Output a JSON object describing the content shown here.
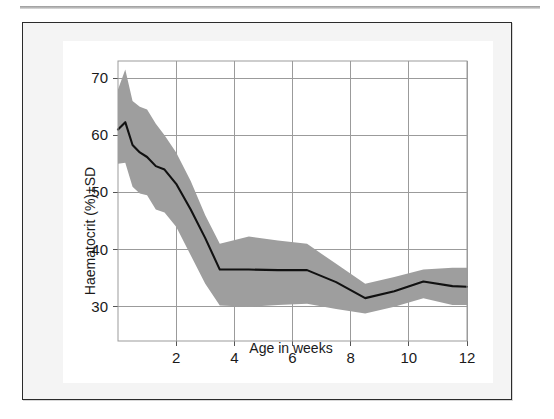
{
  "figure": {
    "background": "#f4f4f4",
    "panel_background": "#ffffff",
    "border_color": "#2b2b2b"
  },
  "chart_data": {
    "type": "line",
    "title": "",
    "subtitle": "",
    "xlabel": "Age in weeks",
    "ylabel": "Haematocrit (%)±SD",
    "xlim": [
      0,
      12
    ],
    "ylim": [
      24,
      73
    ],
    "xticks": [
      2,
      4,
      6,
      8,
      10,
      12
    ],
    "xticklabels": [
      "2",
      "4",
      "6",
      "8",
      "10",
      "12"
    ],
    "yticks": [
      30,
      40,
      50,
      60,
      70
    ],
    "yticklabels": [
      "30",
      "40",
      "50",
      "60",
      "70"
    ],
    "grid": true,
    "grid_color": "#9b9b9b",
    "legend": "none",
    "band_color": "#9e9e9e",
    "line_color": "#111111",
    "band_label": "± 1 SD",
    "x": [
      0.0,
      0.25,
      0.5,
      0.75,
      1.0,
      1.3,
      1.6,
      2.0,
      2.5,
      3.0,
      3.5,
      4.5,
      5.5,
      6.5,
      7.5,
      8.5,
      9.5,
      10.5,
      11.5,
      12.0
    ],
    "series": [
      {
        "name": "Haematocrit mean",
        "values": [
          61.0,
          62.3,
          58.3,
          57.0,
          56.2,
          54.6,
          54.0,
          51.5,
          47.0,
          42.0,
          36.5,
          36.5,
          36.4,
          36.4,
          34.3,
          31.5,
          32.7,
          34.4,
          33.6,
          33.5
        ]
      },
      {
        "name": "Mean + SD",
        "values": [
          68.0,
          71.5,
          66.0,
          65.0,
          64.5,
          62.0,
          60.0,
          57.0,
          52.0,
          46.0,
          41.0,
          42.3,
          41.6,
          41.0,
          37.5,
          34.0,
          35.2,
          36.5,
          36.8,
          36.8
        ]
      },
      {
        "name": "Mean - SD",
        "values": [
          55.0,
          55.2,
          51.0,
          49.8,
          49.5,
          47.0,
          46.5,
          44.0,
          39.0,
          34.0,
          30.2,
          30.0,
          30.3,
          30.5,
          29.6,
          28.8,
          30.0,
          31.5,
          30.3,
          30.3
        ]
      }
    ]
  },
  "axes": {
    "y_title": "Haematocrit (%)±SD",
    "x_title": "Age in weeks"
  }
}
